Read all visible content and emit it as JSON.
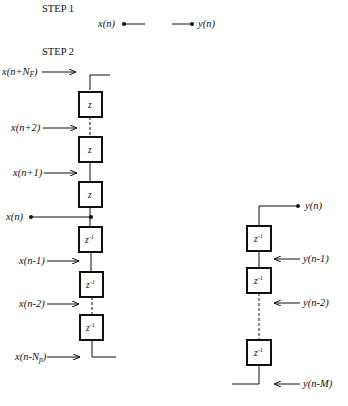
{
  "step1": {
    "title": "STEP 1",
    "input_label": "x(n)",
    "output_label": "y(n)"
  },
  "step2": {
    "title": "STEP 2",
    "left_chain": {
      "input_labels": [
        "x(n+N_F)",
        "x(n+2)",
        "x(n+1)",
        "x(n)",
        "x(n-1)",
        "x(n-2)",
        "x(n-N_p)"
      ],
      "boxes": [
        "z",
        "z",
        "z",
        "z^-1",
        "z^-1",
        "z^-1"
      ]
    },
    "right_chain": {
      "output_label": "y(n)",
      "input_labels": [
        "y(n-1)",
        "y(n-2)",
        "y(n-M)"
      ],
      "boxes": [
        "z^-1",
        "z^-1",
        "z^-1"
      ]
    }
  },
  "text": {
    "x_np_pre": "x(n+N",
    "x_np_sub": "F",
    "x_np_post": ")",
    "x_n2": "x(n+2)",
    "x_n1": "x(n+1)",
    "x_n": "x(n)",
    "x_nm1": "x(n-1)",
    "x_nm2": "x(n-2)",
    "x_nnp_pre": "x(n-N",
    "x_nnp_sub": "p",
    "x_nnp_post": ")",
    "z": "z",
    "zinv": "z",
    "zinv_exp": "-1",
    "y_n": "y(n)",
    "y_nm1": "y(n-1)",
    "y_nm2": "y(n-2)",
    "y_nmM": "y(n-M)"
  }
}
